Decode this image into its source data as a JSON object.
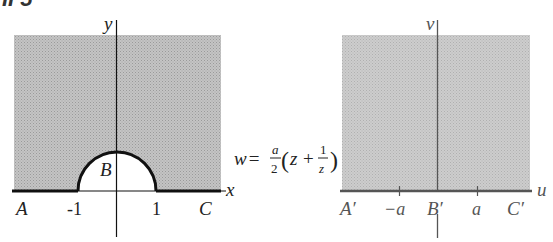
{
  "heading_fragment": "II 5",
  "left_plot": {
    "plane": "z-plane",
    "x_axis_label": "x",
    "y_axis_label": "y",
    "region_label": "B",
    "tick_labels": [
      "-1",
      "1"
    ],
    "point_labels": [
      "A",
      "C"
    ],
    "description": "Upper half-plane shaded except the unit semicircle centered at origin"
  },
  "mapping": {
    "lhs": "w =",
    "frac_a_num": "a",
    "frac_a_den": "2",
    "open_paren": "(",
    "z": "z",
    "plus": "+",
    "frac_1_num": "1",
    "frac_1_den": "z",
    "close_paren": ")"
  },
  "right_plot": {
    "plane": "w-plane",
    "u_axis_label": "u",
    "v_axis_label": "v",
    "point_labels": [
      "A′",
      "B′",
      "C′"
    ],
    "tick_labels": [
      "−a",
      "a"
    ],
    "description": "Entire upper half-plane shaded"
  },
  "colors": {
    "shade": "#b8b8b8",
    "axis": "#1a1a1a",
    "right_axis": "#555555",
    "boundary": "#111111"
  }
}
